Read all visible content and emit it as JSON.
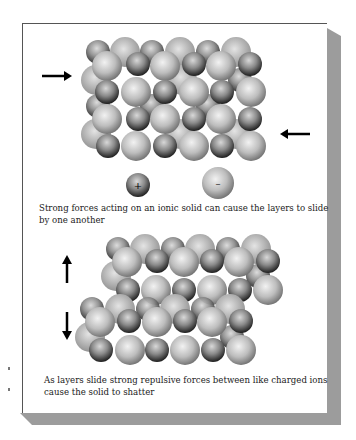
{
  "figure": {
    "caption_top": "Strong forces acting on an ionic solid can cause the layers to slide by one another",
    "caption_bottom": "As layers slide strong repulsive forces between like charged ions cause the solid to shatter",
    "legend": {
      "cation_symbol": "+",
      "anion_symbol": "–",
      "cation_label": "cation",
      "anion_label": "anion"
    },
    "arrows": {
      "top_left": "right-arrow",
      "top_right": "left-arrow",
      "bottom_upper": "up-arrow",
      "bottom_lower": "down-arrow"
    },
    "colors": {
      "panel": "#ffffff",
      "shadow": "#9c9c9c",
      "cation_dark": "#2a2a2a",
      "anion_light": "#d8d8d8"
    }
  }
}
